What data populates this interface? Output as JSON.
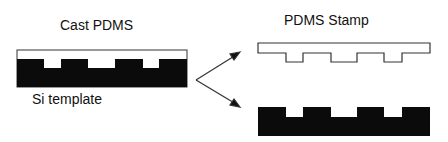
{
  "labels": {
    "cast_pdms": "Cast PDMS",
    "si_template": "Si template",
    "pdms_stamp": "PDMS Stamp"
  },
  "colors": {
    "fill_dark": "#0b0b0b",
    "stroke": "#333333",
    "background": "#ffffff"
  }
}
